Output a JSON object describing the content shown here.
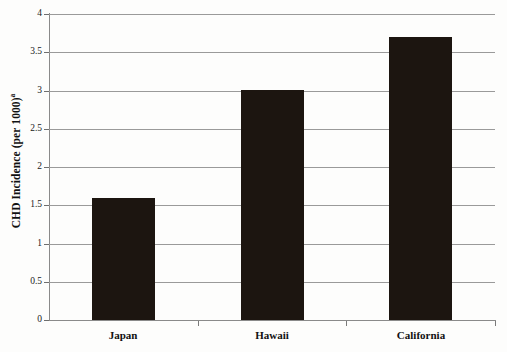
{
  "chart_data": {
    "type": "bar",
    "title": "",
    "xlabel": "",
    "ylabel": "CHD Incidence (per 1000)",
    "ylabel_superscript": "a",
    "categories": [
      "Japan",
      "Hawaii",
      "California"
    ],
    "values": [
      1.6,
      3.0,
      3.7
    ],
    "ylim": [
      0,
      4
    ],
    "ytick_labels": [
      "0",
      "0.5",
      "1",
      "1.5",
      "2",
      "2.5",
      "3",
      "3.5",
      "4"
    ],
    "ytick_values": [
      0,
      0.5,
      1,
      1.5,
      2,
      2.5,
      3,
      3.5,
      4
    ],
    "grid": true,
    "grid_axis": "y",
    "legend": "none",
    "bar_color": "#1c1510",
    "grid_color": "#9a9a9a",
    "axis_color": "#8a8a8a",
    "background_color": "#fdfdfc"
  }
}
